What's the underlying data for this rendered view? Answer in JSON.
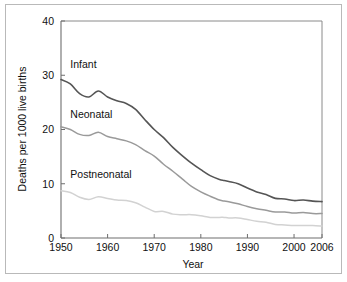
{
  "chart_data": {
    "type": "line",
    "title": "",
    "xlabel": "Year",
    "ylabel": "Deaths per 1000 live births",
    "xlim": [
      1950,
      2006
    ],
    "ylim": [
      0,
      40
    ],
    "xticks": [
      1950,
      1960,
      1970,
      1980,
      1990,
      2000,
      2006
    ],
    "xtick_labels": [
      "1950",
      "1960",
      "1970",
      "1980",
      "1990",
      "2000",
      "2006"
    ],
    "yticks": [
      0,
      10,
      20,
      30,
      40
    ],
    "ytick_labels": [
      "0",
      "10",
      "20",
      "30",
      "40"
    ],
    "grid": false,
    "legend_position": "inline-annotations",
    "x": [
      1950,
      1952,
      1954,
      1956,
      1958,
      1960,
      1962,
      1964,
      1966,
      1968,
      1970,
      1972,
      1974,
      1976,
      1978,
      1980,
      1982,
      1984,
      1985,
      1986,
      1988,
      1990,
      1992,
      1994,
      1996,
      1998,
      2000,
      2002,
      2004,
      2006
    ],
    "series": [
      {
        "name": "Infant",
        "color": "#555555",
        "label_x": 1952,
        "label_y": 31.4,
        "values": [
          29.2,
          28.4,
          26.6,
          26.0,
          27.1,
          26.0,
          25.3,
          24.8,
          23.7,
          21.8,
          20.0,
          18.5,
          16.7,
          15.2,
          13.8,
          12.6,
          11.5,
          10.8,
          10.6,
          10.4,
          10.0,
          9.2,
          8.5,
          8.0,
          7.3,
          7.2,
          6.9,
          7.0,
          6.8,
          6.7
        ]
      },
      {
        "name": "Neonatal",
        "color": "#9a9a9a",
        "label_x": 1952,
        "label_y": 22.2,
        "values": [
          20.5,
          20.0,
          19.1,
          18.9,
          19.5,
          18.7,
          18.3,
          17.9,
          17.2,
          16.1,
          15.1,
          13.6,
          12.3,
          10.9,
          9.5,
          8.5,
          7.7,
          7.0,
          6.8,
          6.7,
          6.3,
          5.8,
          5.4,
          5.1,
          4.8,
          4.8,
          4.6,
          4.7,
          4.5,
          4.5
        ]
      },
      {
        "name": "Postneonatal",
        "color": "#d2d2d2",
        "label_x": 1952,
        "label_y": 11.0,
        "values": [
          8.7,
          8.4,
          7.5,
          7.1,
          7.6,
          7.3,
          7.0,
          6.9,
          6.5,
          5.7,
          4.9,
          4.9,
          4.4,
          4.3,
          4.3,
          4.1,
          3.8,
          3.8,
          3.8,
          3.7,
          3.7,
          3.4,
          3.1,
          2.9,
          2.5,
          2.4,
          2.3,
          2.3,
          2.3,
          2.2
        ]
      }
    ]
  },
  "axes": {
    "x_title": "Year",
    "y_title": "Deaths per 1000 live births"
  }
}
